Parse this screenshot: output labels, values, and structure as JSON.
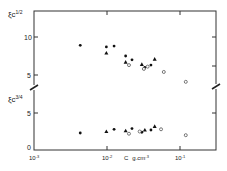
{
  "chart_data": {
    "type": "scatter",
    "title": "",
    "xlabel": "C  g.cm⁻³",
    "xscale": "log",
    "xlim": [
      0.001,
      0.3
    ],
    "x_ticks": [
      "10⁻³",
      "10⁻²",
      "10⁻¹"
    ],
    "panels": [
      {
        "name": "upper",
        "ylabel": "ξc^1/2",
        "y_ticks": [
          "5",
          "10"
        ],
        "ylim": [
          4,
          12
        ],
        "series": [
          {
            "name": "filled circles",
            "marker": "dot",
            "points": [
              [
                0.0043,
                8.9
              ],
              [
                0.0098,
                8.7
              ],
              [
                0.0125,
                8.8
              ],
              [
                0.018,
                7.5
              ],
              [
                0.022,
                7.0
              ],
              [
                0.033,
                6.0
              ],
              [
                0.04,
                6.3
              ]
            ]
          },
          {
            "name": "filled triangles",
            "marker": "triangle",
            "points": [
              [
                0.0098,
                7.9
              ],
              [
                0.018,
                6.7
              ],
              [
                0.03,
                6.4
              ],
              [
                0.045,
                7.1
              ]
            ]
          },
          {
            "name": "open circles",
            "marker": "circle",
            "points": [
              [
                0.02,
                6.3
              ],
              [
                0.032,
                5.8
              ],
              [
                0.036,
                6.1
              ],
              [
                0.06,
                5.4
              ],
              [
                0.12,
                4.1
              ]
            ]
          }
        ]
      },
      {
        "name": "lower",
        "ylabel": "ξc^3/4",
        "y_ticks": [
          "0",
          "5"
        ],
        "ylim": [
          0,
          8
        ],
        "series": [
          {
            "name": "filled circles",
            "marker": "dot",
            "points": [
              [
                0.0043,
                2.3
              ],
              [
                0.0125,
                2.8
              ],
              [
                0.022,
                2.9
              ],
              [
                0.03,
                2.4
              ],
              [
                0.04,
                2.7
              ]
            ]
          },
          {
            "name": "filled triangles",
            "marker": "triangle",
            "points": [
              [
                0.0098,
                2.5
              ],
              [
                0.018,
                2.6
              ],
              [
                0.033,
                2.7
              ],
              [
                0.045,
                3.2
              ]
            ]
          },
          {
            "name": "open circles",
            "marker": "circle",
            "points": [
              [
                0.02,
                2.2
              ],
              [
                0.028,
                2.5
              ],
              [
                0.055,
                2.8
              ],
              [
                0.12,
                2.0
              ]
            ]
          }
        ]
      }
    ]
  },
  "labels": {
    "ylabel_upper_main": "ξc",
    "ylabel_upper_sup": "1/2",
    "ylabel_lower_main": "ξc",
    "ylabel_lower_sup": "3/4",
    "ytick_10": "10",
    "ytick_5_upper": "5",
    "ytick_5_lower": "5",
    "ytick_0": "0",
    "xtick_1": "10",
    "xtick_1_exp": "-3",
    "xtick_2": "10",
    "xtick_2_exp": "-2",
    "xtick_3": "10",
    "xtick_3_exp": "-1",
    "xlabel_c": "C",
    "xlabel_units": "g.cm",
    "xlabel_units_exp": "-3"
  }
}
